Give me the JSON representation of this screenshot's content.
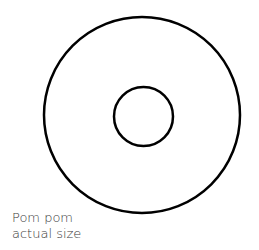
{
  "diagram": {
    "stroke_color": "#000000",
    "background": "#ffffff",
    "outer_circle": {
      "cx": 142,
      "cy": 115,
      "r": 98,
      "stroke_width": 2.5
    },
    "inner_circle": {
      "cx": 143.5,
      "cy": 116.5,
      "r": 29.5,
      "stroke_width": 2.5
    }
  },
  "caption": {
    "line1": "Pom pom",
    "line2": "actual size",
    "color": "#3a3a3a"
  }
}
